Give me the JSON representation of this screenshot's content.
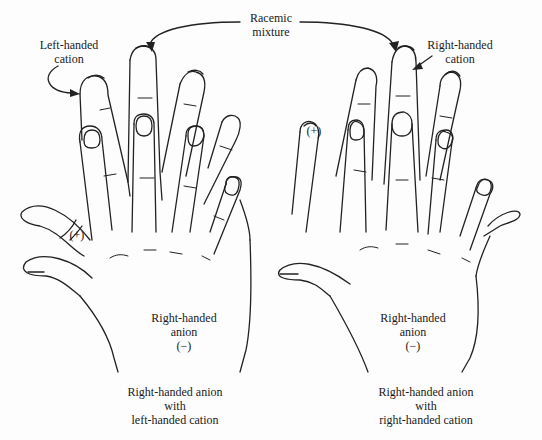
{
  "figure": {
    "top_label": {
      "line1": "Racemic",
      "line2": "mixture"
    },
    "left_panel": {
      "cation_label": {
        "line1": "Left-handed",
        "line2": "cation"
      },
      "cation_sign": "(+)",
      "anion_label": {
        "line1": "Right-handed",
        "line2": "anion",
        "sign": "(−)"
      },
      "caption": {
        "line1": "Right-handed anion",
        "line2": "with",
        "line3": "left-handed cation"
      }
    },
    "right_panel": {
      "cation_label": {
        "line1": "Right-handed",
        "line2": "cation"
      },
      "cation_sign": "(+)",
      "anion_label": {
        "line1": "Right-handed",
        "line2": "anion",
        "sign": "(−)"
      },
      "caption": {
        "line1": "Right-handed anion",
        "line2": "with",
        "line3": "right-handed cation"
      }
    }
  }
}
